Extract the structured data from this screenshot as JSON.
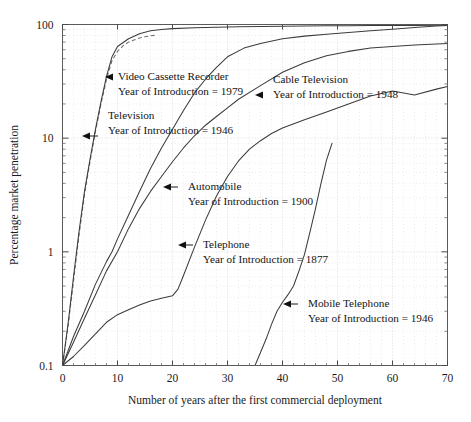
{
  "figure": {
    "background_color": "#ffffff",
    "line_color": "#3c3c3c",
    "grid_color": "#c8c8c8"
  },
  "chart_data": {
    "type": "line",
    "title": "",
    "xlabel": "Number of years after the first commercial deployment",
    "ylabel": "Percentage market penetration",
    "xlim": [
      0,
      70
    ],
    "ylim": [
      0.1,
      100
    ],
    "yscale": "log",
    "xscale": "linear",
    "grid": true,
    "legend_position": "inline-annotations",
    "xticks": [
      0,
      10,
      20,
      30,
      40,
      50,
      60,
      70
    ],
    "xtick_labels": [
      "0",
      "10",
      "20",
      "30",
      "40",
      "50",
      "60",
      "70"
    ],
    "yticks": [
      0.1,
      1,
      10,
      100
    ],
    "ytick_labels": [
      "0.1",
      "1",
      "10",
      "100"
    ],
    "series": [
      {
        "name": "Video Cassette Recorder",
        "year_of_introduction": 1979,
        "style": "dashed",
        "x": [
          0,
          1,
          2,
          3,
          4,
          5,
          6,
          7,
          8,
          9,
          10,
          11,
          12,
          13,
          14,
          15,
          16,
          17
        ],
        "values": [
          0.1,
          0.22,
          0.55,
          1.4,
          3.2,
          6.2,
          11.5,
          20.0,
          33.0,
          48.0,
          58.0,
          65.0,
          70.0,
          73.0,
          76.0,
          78.0,
          79.5,
          80.5
        ]
      },
      {
        "name": "Television",
        "year_of_introduction": 1946,
        "style": "solid",
        "x": [
          0,
          1,
          2,
          3,
          4,
          5,
          6,
          7,
          8,
          9,
          10,
          12,
          14,
          16,
          18,
          20,
          24,
          28,
          32,
          36,
          40,
          44,
          48,
          52,
          56,
          60,
          64,
          68,
          70
        ],
        "values": [
          0.1,
          0.23,
          0.6,
          1.5,
          3.4,
          6.5,
          12.0,
          21.0,
          35.0,
          52.0,
          64.0,
          75.0,
          83.0,
          88.0,
          90.5,
          92.0,
          93.5,
          94.5,
          95.5,
          96.0,
          96.5,
          97.0,
          97.3,
          97.6,
          97.8,
          98.0,
          98.2,
          98.4,
          98.5
        ]
      },
      {
        "name": "Automobile",
        "year_of_introduction": 1900,
        "style": "solid",
        "x": [
          0,
          2,
          4,
          6,
          8,
          9,
          10,
          12,
          14,
          16,
          18,
          20,
          22,
          24,
          26,
          28,
          30,
          33,
          36,
          40,
          44,
          48,
          52,
          56,
          60,
          64,
          68,
          70
        ],
        "values": [
          0.1,
          0.18,
          0.3,
          0.52,
          0.82,
          1.0,
          1.3,
          2.1,
          3.4,
          5.4,
          8.2,
          12.0,
          17.5,
          25.0,
          33.0,
          42.0,
          52.0,
          62.0,
          68.0,
          75.0,
          79.0,
          82.0,
          85.0,
          88.0,
          91.0,
          94.0,
          97.0,
          98.0
        ]
      },
      {
        "name": "Cable Television",
        "year_of_introduction": 1948,
        "style": "solid",
        "x": [
          0,
          2,
          4,
          6,
          8,
          10,
          12,
          14,
          16,
          18,
          20,
          22,
          24,
          26,
          28,
          30,
          32,
          36,
          40,
          44,
          48,
          52,
          56,
          60,
          64,
          68,
          70
        ],
        "values": [
          0.1,
          0.16,
          0.26,
          0.42,
          0.68,
          1.0,
          1.6,
          2.4,
          3.4,
          4.6,
          6.2,
          8.2,
          10.5,
          13.0,
          15.5,
          18.5,
          22.0,
          29.0,
          38.0,
          46.0,
          53.0,
          58.0,
          62.0,
          64.0,
          66.0,
          67.5,
          68.0
        ]
      },
      {
        "name": "Telephone",
        "year_of_introduction": 1877,
        "style": "solid",
        "x": [
          0,
          2,
          4,
          6,
          8,
          10,
          12,
          14,
          16,
          18,
          20,
          21,
          22,
          24,
          26,
          28,
          30,
          32,
          34,
          36,
          38,
          40,
          44,
          48,
          52,
          56,
          60,
          64,
          68,
          70
        ],
        "values": [
          0.1,
          0.12,
          0.15,
          0.19,
          0.24,
          0.28,
          0.31,
          0.34,
          0.37,
          0.39,
          0.41,
          0.47,
          0.62,
          1.1,
          1.9,
          3.1,
          4.6,
          6.3,
          8.0,
          9.5,
          11.0,
          12.3,
          14.5,
          17.0,
          20.0,
          23.5,
          26.0,
          24.0,
          27.0,
          28.5
        ]
      },
      {
        "name": "Mobile Telephone",
        "year_of_introduction": 1946,
        "style": "solid",
        "x": [
          35,
          36,
          37,
          38,
          39,
          40,
          41,
          42,
          43,
          44,
          45,
          46,
          47,
          48,
          49
        ],
        "values": [
          0.1,
          0.13,
          0.17,
          0.23,
          0.3,
          0.36,
          0.42,
          0.5,
          0.68,
          0.95,
          1.5,
          2.4,
          4.0,
          6.4,
          9.0
        ]
      }
    ],
    "annotations": [
      {
        "id": "vcr",
        "label_line1": "Video Cassette Recorder",
        "label_line2": "Year of Introduction = 1979",
        "points_to_x": 7.2,
        "points_to_y": 26
      },
      {
        "id": "television",
        "label_line1": "Television",
        "label_line2": "Year of Introduction = 1946",
        "points_to_x": 5.3,
        "points_to_y": 9.0
      },
      {
        "id": "cable-television",
        "label_line1": "Cable Television",
        "label_line2": "Year of Introduction = 1948",
        "points_to_x": 31.5,
        "points_to_y": 22
      },
      {
        "id": "automobile",
        "label_line1": "Automobile",
        "label_line2": "Year of Introduction = 1900",
        "points_to_x": 15.0,
        "points_to_y": 3.3
      },
      {
        "id": "telephone",
        "label_line1": "Telephone",
        "label_line2": "Year of Introduction = 1877",
        "points_to_x": 21.5,
        "points_to_y": 0.92
      },
      {
        "id": "mobile-telephone",
        "label_line1": "Mobile Telephone",
        "label_line2": "Year of Introduction = 1946",
        "points_to_x": 42.5,
        "points_to_y": 0.36
      }
    ]
  }
}
